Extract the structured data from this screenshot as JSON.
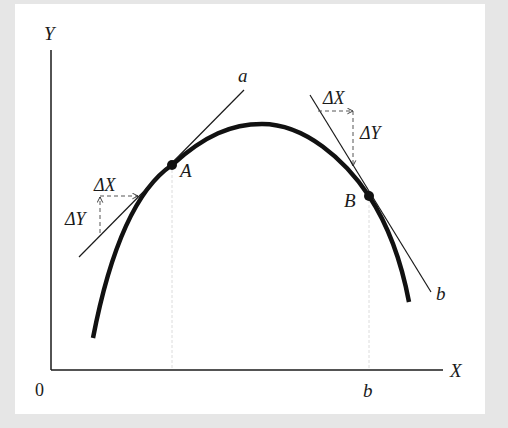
{
  "figure": {
    "axes": {
      "y_label": "Y",
      "x_label": "X",
      "origin_label": "0",
      "x_tick_label": "b"
    },
    "points": {
      "A": "A",
      "B": "B"
    },
    "tangents": {
      "a_label": "a",
      "b_label": "b"
    },
    "increments": {
      "at_A": {
        "dx": "ΔX",
        "dy": "ΔY"
      },
      "at_B": {
        "dx": "ΔX",
        "dy": "ΔY"
      }
    },
    "colors": {
      "ink": "#1a1a1a",
      "guide": "#d9d9d9",
      "background": "#e6e6e6",
      "panel": "#ffffff"
    }
  }
}
